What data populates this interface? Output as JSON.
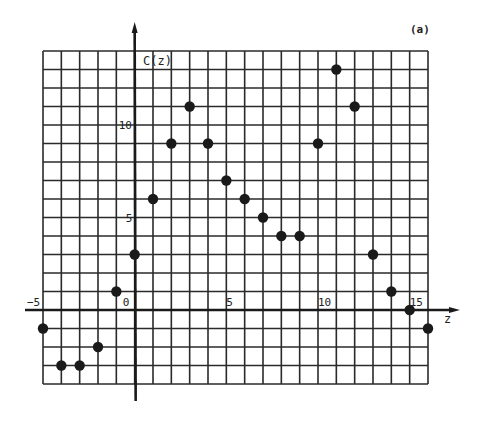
{
  "chart_data": {
    "type": "scatter",
    "panel_label": "(a)",
    "title": "",
    "xlabel": "z",
    "ylabel": "C(z)",
    "xlim": [
      -5,
      16
    ],
    "ylim": [
      -4,
      14
    ],
    "grid": true,
    "grid_step": 1,
    "x_ticks": [
      {
        "value": -5,
        "label": "-5"
      },
      {
        "value": 0,
        "label": "0"
      },
      {
        "value": 5,
        "label": "5"
      },
      {
        "value": 10,
        "label": "10"
      },
      {
        "value": 15,
        "label": "15"
      }
    ],
    "y_ticks": [
      {
        "value": 5,
        "label": "5"
      },
      {
        "value": 10,
        "label": "10"
      }
    ],
    "series": [
      {
        "name": "C(z)",
        "marker": "filled-circle",
        "color": "#1a1a1a",
        "x": [
          -5,
          -4,
          -3,
          -2,
          -1,
          0,
          1,
          2,
          3,
          4,
          5,
          6,
          7,
          8,
          9,
          10,
          11,
          12,
          13,
          14,
          15,
          16
        ],
        "y": [
          -1,
          -3,
          -3,
          -2,
          1,
          3,
          6,
          9,
          11,
          9,
          7,
          6,
          5,
          4,
          4,
          9,
          13,
          11,
          3,
          1,
          0,
          -1
        ]
      }
    ]
  },
  "colors": {
    "grid": "#2a2a2a",
    "axis": "#1a1a1a",
    "marker": "#1a1a1a",
    "background": "#ffffff"
  }
}
